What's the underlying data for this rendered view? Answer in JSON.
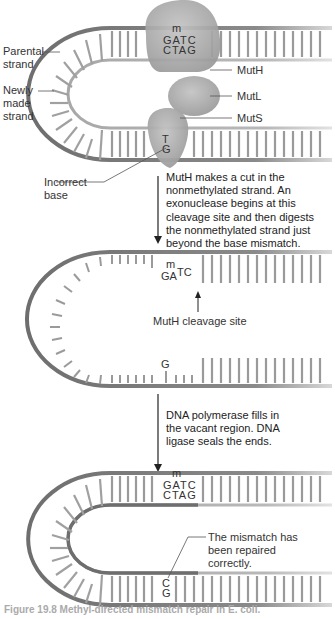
{
  "diagram": {
    "title": "Methyl-directed mismatch repair",
    "panel1": {
      "labels": {
        "parental_strand": "Parental strand",
        "newly_made_strand": "Newly made strand",
        "incorrect_base": "Incorrect base",
        "muth": "MutH",
        "mutl": "MutL",
        "muts": "MutS"
      },
      "site_top": "GATC",
      "site_bottom": "CTAG",
      "methyl_mark": "m",
      "mismatch_top": "T",
      "mismatch_bottom": "G"
    },
    "step1_text": "MutH makes a cut in the nonmethylated strand. An exonuclease begins at this cleavage site and then digests the nonmethylated strand just beyond the base mismatch.",
    "panel2": {
      "site_top": "GATC",
      "methyl_mark": "m",
      "cleavage_label": "MutH cleavage site",
      "mismatch_base": "G"
    },
    "step2_text": "DNA polymerase fills in the vacant region. DNA ligase seals the ends.",
    "panel3": {
      "site_top": "GATC",
      "site_bottom": "CTAG",
      "methyl_mark": "m",
      "repaired_top": "C",
      "repaired_bottom": "G",
      "repaired_label": "The mismatch has been repaired correctly."
    },
    "caption": "Figure 19.8  Methyl-directed mismatch repair in E. coli.",
    "colors": {
      "parental": "#6e6e6e",
      "newly_made": "#a8a8a8",
      "protein": "#a9a9a9",
      "text": "#222222"
    }
  }
}
